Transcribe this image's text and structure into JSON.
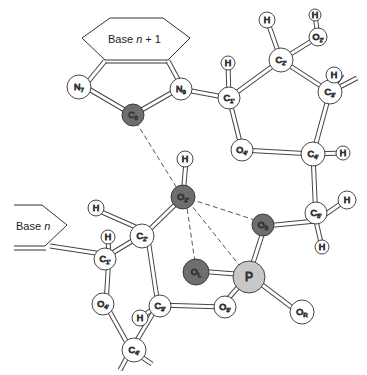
{
  "diagram": {
    "type": "molecular-structure",
    "colors": {
      "white_atom": "#ffffff",
      "dark_atom": "#6e6e6e",
      "light_atom": "#c8c8c8",
      "bond_outline": "#444444",
      "dashed_line": "#444444"
    },
    "base_upper": {
      "label_prefix": "Base ",
      "label_italic": "n",
      "label_suffix": " + 1"
    },
    "base_lower": {
      "label_prefix": "Base ",
      "label_italic": "n"
    },
    "atoms": {
      "N7": {
        "main": "N",
        "sub": "7"
      },
      "N9": {
        "main": "N",
        "sub": "9"
      },
      "C8": {
        "main": "C",
        "sub": "8"
      },
      "C1p_upper": {
        "main": "C",
        "sub": "1'"
      },
      "C2p_upper": {
        "main": "C",
        "sub": "2'"
      },
      "C3p_upper": {
        "main": "C",
        "sub": "3'"
      },
      "C4p_upper": {
        "main": "C",
        "sub": "4'"
      },
      "O4p_upper": {
        "main": "O",
        "sub": "4'"
      },
      "O2p_upper": {
        "main": "O",
        "sub": "2'"
      },
      "C5p": {
        "main": "C",
        "sub": "5'"
      },
      "O5": {
        "main": "O",
        "sub": "5"
      },
      "P": {
        "main": "P",
        "sub": ""
      },
      "OL": {
        "main": "O",
        "sub": "L"
      },
      "OR": {
        "main": "O",
        "sub": "R"
      },
      "O3p": {
        "main": "O",
        "sub": "3'"
      },
      "O2p_lower": {
        "main": "O",
        "sub": "2'"
      },
      "C2p_lower": {
        "main": "C",
        "sub": "2'"
      },
      "C1p_lower": {
        "main": "C",
        "sub": "1'"
      },
      "O4p_lower": {
        "main": "O",
        "sub": "4'"
      },
      "C3p_lower": {
        "main": "C",
        "sub": "3'"
      },
      "C4p_lower": {
        "main": "C",
        "sub": "4'"
      },
      "H": {
        "main": "H",
        "sub": ""
      }
    }
  }
}
